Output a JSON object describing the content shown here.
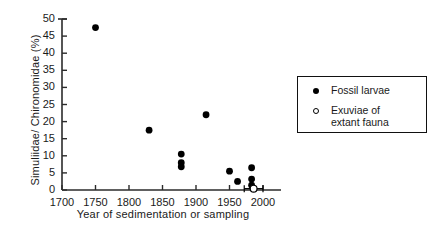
{
  "chart_data": {
    "type": "scatter",
    "title": "",
    "xlabel": "Year of sedimentation or sampling",
    "ylabel": "Simuliidae/ Chironomidae  (%)",
    "xlim": [
      1700,
      2000
    ],
    "ylim": [
      0,
      50
    ],
    "xticks": [
      1700,
      1750,
      1800,
      1850,
      1900,
      1950,
      2000
    ],
    "xticklabels": [
      "1700",
      "1750",
      "1800",
      "1850",
      "1900",
      "1950",
      "2000"
    ],
    "yticks": [
      0,
      5,
      10,
      15,
      20,
      25,
      30,
      35,
      40,
      45,
      50
    ],
    "yticklabels": [
      "0",
      "5",
      "10",
      "15",
      "20",
      "25",
      "30",
      "35",
      "40",
      "45",
      "50"
    ],
    "grid": false,
    "legend_position": "upper right",
    "series": [
      {
        "name": "Fossil larvae",
        "marker": "filled-circle",
        "color": "#000000",
        "points": [
          {
            "x": 1750,
            "y": 47.5
          },
          {
            "x": 1830,
            "y": 17.5
          },
          {
            "x": 1878,
            "y": 10.5
          },
          {
            "x": 1878,
            "y": 8.0
          },
          {
            "x": 1878,
            "y": 6.8
          },
          {
            "x": 1915,
            "y": 22.0
          },
          {
            "x": 1950,
            "y": 5.5
          },
          {
            "x": 1962,
            "y": 2.5
          },
          {
            "x": 1983,
            "y": 6.5
          },
          {
            "x": 1983,
            "y": 3.2
          },
          {
            "x": 1983,
            "y": 1.4
          }
        ]
      },
      {
        "name": "Exuviae of extant fauna",
        "marker": "open-circle",
        "color": "#000000",
        "points": [
          {
            "x": 1986,
            "y": 0.4,
            "xerr": 14
          }
        ]
      }
    ]
  },
  "legend": {
    "entries": [
      {
        "label": "Fossil larvae",
        "marker": "filled-circle"
      },
      {
        "label": "Exuviae of\nextant fauna",
        "marker": "open-circle"
      }
    ]
  }
}
